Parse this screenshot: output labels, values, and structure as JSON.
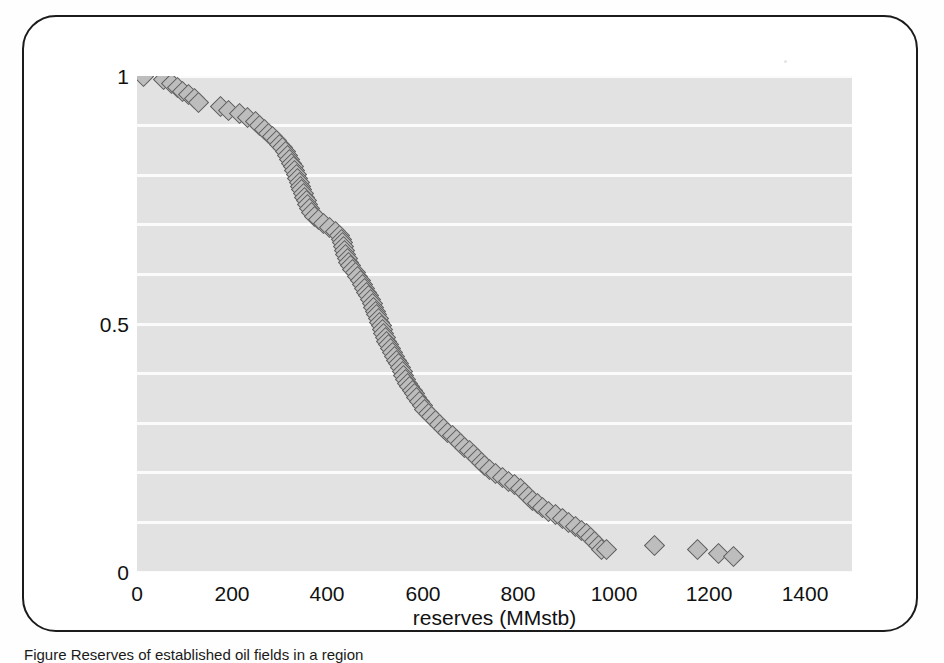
{
  "figure": {
    "frame_color": "#1b1b1b",
    "plot_background": "#e2e2e2",
    "gridline_color": "#fbfbfb",
    "marker_fill": "#bdbdbd",
    "marker_edge": "#5d5d5d"
  },
  "caption": {
    "label": "Figure",
    "text": "Figure    Reserves of established oil fields in a region"
  },
  "chart_data": {
    "type": "scatter",
    "title": "",
    "xlabel": "reserves (MMstb)",
    "ylabel": "",
    "xlim": [
      0,
      1500
    ],
    "ylim": [
      0,
      1
    ],
    "xticks": [
      0,
      200,
      400,
      600,
      800,
      1000,
      1200,
      1400
    ],
    "xticklabels": [
      "0",
      "200",
      "400",
      "600",
      "800",
      "1000",
      "1200",
      "1400"
    ],
    "yticks": [
      0,
      0.5,
      1
    ],
    "yticklabels": [
      "0",
      "0.5",
      "1"
    ],
    "grid": "horizontal",
    "gridline_values": [
      0.0,
      0.1,
      0.2,
      0.3,
      0.4,
      0.5,
      0.6,
      0.7,
      0.8,
      0.9,
      1.0
    ],
    "legend": null,
    "marker": "diamond",
    "series": [
      {
        "name": "cumulative exceedance probability",
        "points": [
          [
            14,
            1.0
          ],
          [
            55,
            0.992
          ],
          [
            72,
            0.985
          ],
          [
            84,
            0.977
          ],
          [
            96,
            0.969
          ],
          [
            108,
            0.962
          ],
          [
            120,
            0.954
          ],
          [
            130,
            0.947
          ],
          [
            175,
            0.939
          ],
          [
            193,
            0.931
          ],
          [
            215,
            0.924
          ],
          [
            232,
            0.916
          ],
          [
            248,
            0.908
          ],
          [
            258,
            0.901
          ],
          [
            268,
            0.893
          ],
          [
            276,
            0.885
          ],
          [
            284,
            0.878
          ],
          [
            292,
            0.87
          ],
          [
            298,
            0.862
          ],
          [
            305,
            0.855
          ],
          [
            311,
            0.847
          ],
          [
            316,
            0.839
          ],
          [
            320,
            0.832
          ],
          [
            324,
            0.824
          ],
          [
            328,
            0.817
          ],
          [
            331,
            0.809
          ],
          [
            334,
            0.801
          ],
          [
            337,
            0.794
          ],
          [
            340,
            0.786
          ],
          [
            343,
            0.778
          ],
          [
            346,
            0.771
          ],
          [
            349,
            0.763
          ],
          [
            352,
            0.755
          ],
          [
            355,
            0.748
          ],
          [
            358,
            0.74
          ],
          [
            362,
            0.732
          ],
          [
            366,
            0.725
          ],
          [
            372,
            0.717
          ],
          [
            380,
            0.71
          ],
          [
            391,
            0.702
          ],
          [
            404,
            0.694
          ],
          [
            416,
            0.687
          ],
          [
            425,
            0.679
          ],
          [
            430,
            0.671
          ],
          [
            432,
            0.664
          ],
          [
            434,
            0.656
          ],
          [
            436,
            0.648
          ],
          [
            438,
            0.641
          ],
          [
            441,
            0.633
          ],
          [
            444,
            0.625
          ],
          [
            448,
            0.618
          ],
          [
            453,
            0.61
          ],
          [
            458,
            0.603
          ],
          [
            463,
            0.595
          ],
          [
            468,
            0.587
          ],
          [
            473,
            0.58
          ],
          [
            478,
            0.572
          ],
          [
            482,
            0.564
          ],
          [
            486,
            0.557
          ],
          [
            490,
            0.549
          ],
          [
            494,
            0.542
          ],
          [
            497,
            0.534
          ],
          [
            500,
            0.526
          ],
          [
            503,
            0.519
          ],
          [
            506,
            0.511
          ],
          [
            509,
            0.503
          ],
          [
            512,
            0.496
          ],
          [
            515,
            0.488
          ],
          [
            518,
            0.481
          ],
          [
            521,
            0.473
          ],
          [
            524,
            0.465
          ],
          [
            528,
            0.458
          ],
          [
            532,
            0.45
          ],
          [
            536,
            0.442
          ],
          [
            540,
            0.435
          ],
          [
            544,
            0.427
          ],
          [
            548,
            0.42
          ],
          [
            552,
            0.412
          ],
          [
            556,
            0.404
          ],
          [
            560,
            0.397
          ],
          [
            564,
            0.389
          ],
          [
            568,
            0.381
          ],
          [
            572,
            0.374
          ],
          [
            577,
            0.366
          ],
          [
            582,
            0.359
          ],
          [
            587,
            0.351
          ],
          [
            592,
            0.343
          ],
          [
            598,
            0.336
          ],
          [
            604,
            0.328
          ],
          [
            611,
            0.32
          ],
          [
            618,
            0.313
          ],
          [
            626,
            0.305
          ],
          [
            634,
            0.298
          ],
          [
            643,
            0.29
          ],
          [
            652,
            0.282
          ],
          [
            661,
            0.275
          ],
          [
            670,
            0.267
          ],
          [
            679,
            0.26
          ],
          [
            688,
            0.252
          ],
          [
            697,
            0.244
          ],
          [
            706,
            0.237
          ],
          [
            714,
            0.229
          ],
          [
            722,
            0.221
          ],
          [
            730,
            0.214
          ],
          [
            740,
            0.206
          ],
          [
            752,
            0.199
          ],
          [
            766,
            0.191
          ],
          [
            780,
            0.183
          ],
          [
            793,
            0.176
          ],
          [
            804,
            0.168
          ],
          [
            813,
            0.16
          ],
          [
            821,
            0.153
          ],
          [
            830,
            0.145
          ],
          [
            840,
            0.138
          ],
          [
            851,
            0.13
          ],
          [
            864,
            0.122
          ],
          [
            878,
            0.115
          ],
          [
            892,
            0.107
          ],
          [
            906,
            0.099
          ],
          [
            920,
            0.092
          ],
          [
            933,
            0.084
          ],
          [
            944,
            0.077
          ],
          [
            952,
            0.069
          ],
          [
            960,
            0.061
          ],
          [
            968,
            0.054
          ],
          [
            975,
            0.046
          ],
          [
            985,
            0.046
          ],
          [
            1085,
            0.054
          ],
          [
            1175,
            0.046
          ],
          [
            1220,
            0.038
          ],
          [
            1252,
            0.031
          ]
        ]
      }
    ]
  }
}
